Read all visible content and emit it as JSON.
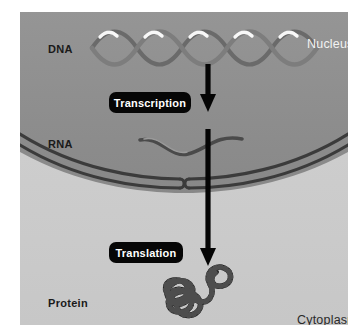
{
  "figure": {
    "width": 359,
    "height": 334,
    "background": "#ffffff"
  },
  "colors": {
    "nucleus_fill": "#8e8e8e",
    "cytoplasm_fill": "#cdcdcd",
    "membrane_line": "#3b3b3b",
    "arrow": "#050505",
    "badge_background": "#060606",
    "badge_text": "#ffffff",
    "label_dark": "#1a1a1a",
    "label_light": "#f2f2f2",
    "dna_strand": "#6f6f6f",
    "dna_highlight": "#ffffff",
    "rna_strand": "#4a4a4a",
    "protein_bead": "#1c1c1c"
  },
  "regions": {
    "nucleus": {
      "label": "Nucleus",
      "text_color": "#f2f2f2"
    },
    "cytoplasm": {
      "label": "Cytoplasm",
      "text_color": "#2a2a2a"
    }
  },
  "molecules": {
    "dna": {
      "label": "DNA",
      "type": "double-helix",
      "turns": 5,
      "highlight_count": 5
    },
    "rna": {
      "label": "RNA",
      "type": "single-strand-wave"
    },
    "protein": {
      "label": "Protein",
      "type": "beaded-coiled-chain"
    }
  },
  "processes": [
    {
      "label": "Transcription",
      "from": "DNA",
      "to": "RNA",
      "arrow": "down-arrow-transcription"
    },
    {
      "label": "Translation",
      "from": "RNA",
      "to": "Protein",
      "arrow": "down-arrow-translation"
    }
  ],
  "structures": {
    "nuclear_envelope": {
      "name": "nuclear-envelope",
      "type": "double-membrane",
      "pore": true
    }
  }
}
